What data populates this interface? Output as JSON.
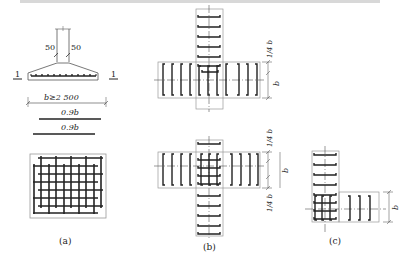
{
  "header_fragment": "（a）条形基础底板钢筋布置与交叉、转角处钢筋布置示意图",
  "panel_a": {
    "caption": "(a)",
    "dim_left": "50",
    "dim_right": "50",
    "section_mark_left": "1",
    "section_mark_right": "1",
    "width_label": "b≥2 500",
    "bar_label_1": "0.9b",
    "bar_label_2": "0.9b"
  },
  "panel_b": {
    "caption": "(b)",
    "top_dim_quarter": "1/4 b",
    "top_dim_b": "b",
    "bottom_dim_quarter_top": "1/4 b",
    "bottom_dim_b": "b",
    "bottom_dim_quarter_bottom": "1/4 b"
  },
  "panel_c": {
    "caption": "(c)",
    "dim_b": "b"
  },
  "colors": {
    "ink": "#222222",
    "rebar": "#333333",
    "outline": "#888888",
    "background": "#ffffff"
  }
}
